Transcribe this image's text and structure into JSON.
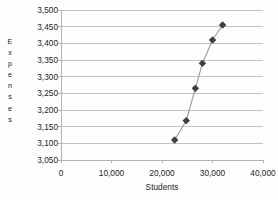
{
  "chart_data": {
    "type": "scatter",
    "title": "",
    "xlabel": "Students",
    "ylabel": "Expenses",
    "ylabel_letters": "E\nx\np\ne\nn\ns\ne\ns",
    "xlim": [
      0,
      40000
    ],
    "ylim": [
      3050,
      3500
    ],
    "xticks": [
      0,
      10000,
      20000,
      30000,
      40000
    ],
    "xtick_labels": [
      "0",
      "10,000",
      "20,000",
      "30,000",
      "40,000"
    ],
    "yticks": [
      3050,
      3100,
      3150,
      3200,
      3250,
      3300,
      3350,
      3400,
      3450,
      3500
    ],
    "ytick_labels": [
      "3,050",
      "3,100",
      "3,150",
      "3,200",
      "3,250",
      "3,300",
      "3,350",
      "3,400",
      "3,450",
      "3,500"
    ],
    "grid": "horizontal",
    "legend": "none",
    "connected": true,
    "marker": "diamond",
    "series": [
      {
        "name": "Expenses vs Students",
        "color": "#3f3f3f",
        "line_color": "#9a9a9a",
        "x": [
          22500,
          24800,
          26600,
          28000,
          30000,
          32000
        ],
        "y": [
          3110,
          3168,
          3265,
          3340,
          3410,
          3455
        ],
        "points": [
          {
            "x": 22500,
            "y": 3110
          },
          {
            "x": 24800,
            "y": 3168
          },
          {
            "x": 26600,
            "y": 3265
          },
          {
            "x": 28000,
            "y": 3340
          },
          {
            "x": 30000,
            "y": 3410
          },
          {
            "x": 32000,
            "y": 3455
          }
        ]
      }
    ]
  },
  "style": {
    "grid_color": "#b3b3b3",
    "axis_color": "#b3b3b3",
    "background": "#fdfdfd",
    "text_color": "#231f20",
    "marker_color": "#3f3f3f",
    "line_color": "#9a9a9a"
  },
  "geometry": {
    "plot_left": 61,
    "plot_right": 263,
    "plot_top": 10,
    "plot_bottom": 160
  }
}
